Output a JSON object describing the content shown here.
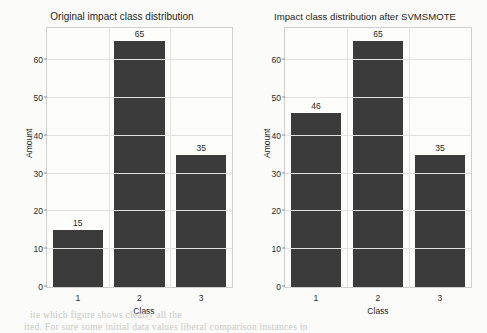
{
  "page": {
    "background_color": "#fbfbf9",
    "bleed_text_top": "",
    "bleed_text_line1": "ite which figure shows clearly all the",
    "bleed_text_line2": "ited. For sure some initial data values  liberal  comparison instances in"
  },
  "charts": [
    {
      "id": "original-distribution",
      "title": "Original impact class distribution",
      "xlabel": "Class",
      "ylabel": "Amount",
      "categories": [
        "1",
        "2",
        "3"
      ],
      "values": [
        15,
        65,
        35
      ],
      "bar_color": "#3b3b3b"
    },
    {
      "id": "svmsmote-distribution",
      "title": "Impact class distribution after SVMSMOTE",
      "xlabel": "Class",
      "ylabel": "Amount",
      "categories": [
        "1",
        "2",
        "3"
      ],
      "values": [
        46,
        65,
        35
      ],
      "bar_color": "#3b3b3b"
    }
  ],
  "axis": {
    "yticks": [
      "0",
      "10",
      "20",
      "30",
      "40",
      "50",
      "60"
    ],
    "ymin": 0,
    "ymax": 68.5
  },
  "chart_data": [
    {
      "type": "bar",
      "title": "Original impact class distribution",
      "categories": [
        "1",
        "2",
        "3"
      ],
      "values": [
        15,
        65,
        35
      ],
      "xlabel": "Class",
      "ylabel": "Amount",
      "ylim": [
        0,
        68.5
      ],
      "yticks": [
        0,
        10,
        20,
        30,
        40,
        50,
        60
      ],
      "grid": true,
      "legend": "none",
      "data_labels": [
        "15",
        "65",
        "35"
      ],
      "bar_color": "#3b3b3b"
    },
    {
      "type": "bar",
      "title": "Impact class distribution after SVMSMOTE",
      "categories": [
        "1",
        "2",
        "3"
      ],
      "values": [
        46,
        65,
        35
      ],
      "xlabel": "Class",
      "ylabel": "Amount",
      "ylim": [
        0,
        68.5
      ],
      "yticks": [
        0,
        10,
        20,
        30,
        40,
        50,
        60
      ],
      "grid": true,
      "legend": "none",
      "data_labels": [
        "46",
        "65",
        "35"
      ],
      "bar_color": "#3b3b3b"
    }
  ]
}
